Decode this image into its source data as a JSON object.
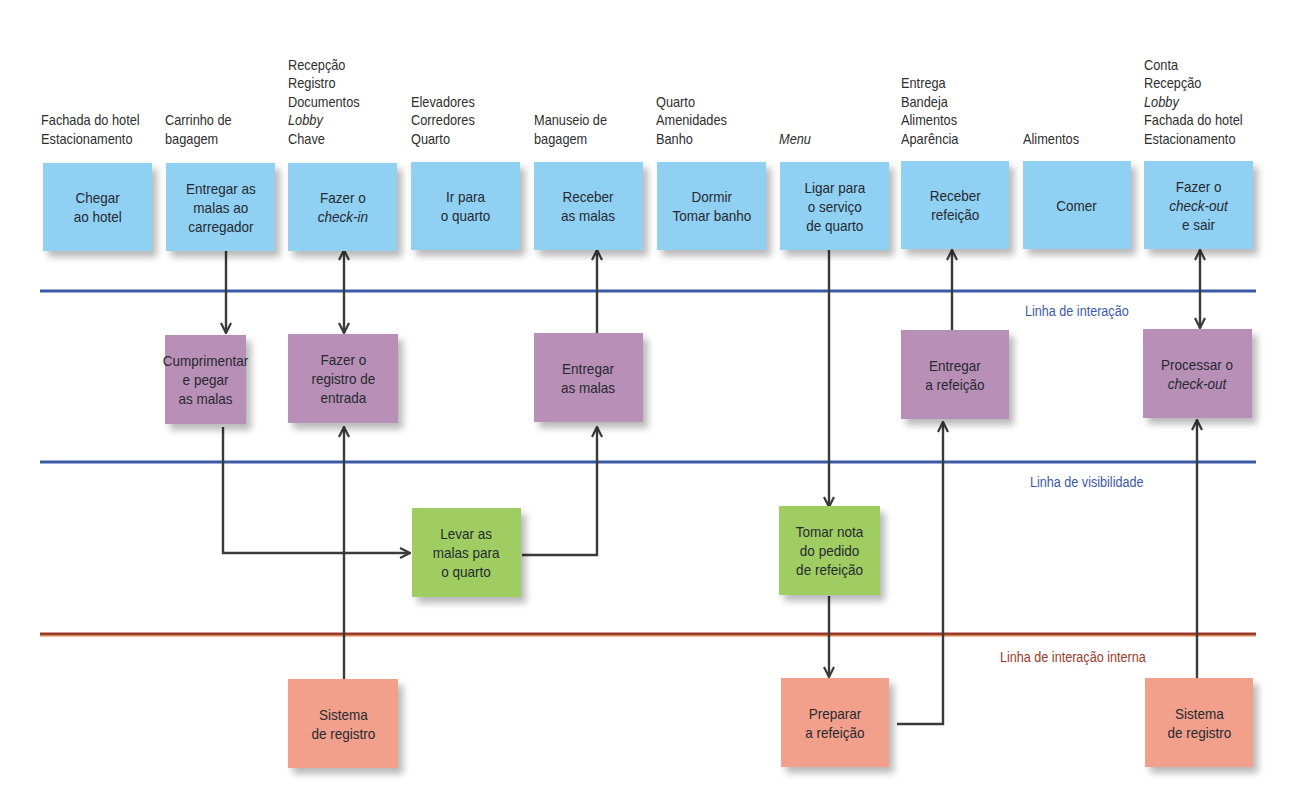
{
  "diagram": {
    "type": "service-blueprint",
    "colors": {
      "customer_actions": "#8fd0f3",
      "onstage_actions": "#b88fb6",
      "backstage_actions": "#9fcd62",
      "support_processes": "#f2a08b",
      "line_interaction": "#3b5aa6",
      "line_visibility": "#3b5aa6",
      "line_internal_interaction": "#9a3a2a",
      "arrow": "#3a3a3a"
    },
    "lines": {
      "interaction": "Linha de interação",
      "visibility": "Linha de visibilidade",
      "internal_interaction": "Linha de interação interna"
    },
    "physical_evidence": [
      {
        "lines": [
          {
            "t": "Fachada do hotel"
          },
          {
            "t": "Estacionamento"
          }
        ]
      },
      {
        "lines": [
          {
            "t": "Carrinho de"
          },
          {
            "t": "bagagem"
          }
        ]
      },
      {
        "lines": [
          {
            "t": "Recepção"
          },
          {
            "t": "Registro"
          },
          {
            "t": "Documentos"
          },
          {
            "t": "Lobby",
            "italic": true
          },
          {
            "t": "Chave"
          }
        ]
      },
      {
        "lines": [
          {
            "t": "Elevadores"
          },
          {
            "t": "Corredores"
          },
          {
            "t": "Quarto"
          }
        ]
      },
      {
        "lines": [
          {
            "t": "Manuseio de"
          },
          {
            "t": "bagagem"
          }
        ]
      },
      {
        "lines": [
          {
            "t": "Quarto"
          },
          {
            "t": "Amenidades"
          },
          {
            "t": "Banho"
          }
        ]
      },
      {
        "lines": [
          {
            "t": "Menu",
            "italic": true
          }
        ]
      },
      {
        "lines": [
          {
            "t": "Entrega"
          },
          {
            "t": "Bandeja"
          },
          {
            "t": "Alimentos"
          },
          {
            "t": "Aparência"
          }
        ]
      },
      {
        "lines": [
          {
            "t": "Alimentos"
          }
        ]
      },
      {
        "lines": [
          {
            "t": "Conta"
          },
          {
            "t": "Recepção"
          },
          {
            "t": "Lobby",
            "italic": true
          },
          {
            "t": "Fachada do hotel"
          },
          {
            "t": "Estacionamento"
          }
        ]
      }
    ],
    "customer_actions": [
      {
        "lines": [
          {
            "t": "Chegar"
          },
          {
            "t": "ao hotel"
          }
        ]
      },
      {
        "lines": [
          {
            "t": "Entregar as"
          },
          {
            "t": "malas ao"
          },
          {
            "t": "carregador"
          }
        ]
      },
      {
        "lines": [
          {
            "t": "Fazer o"
          },
          {
            "t": "check-in",
            "italic": true
          }
        ]
      },
      {
        "lines": [
          {
            "t": "Ir para"
          },
          {
            "t": "o quarto"
          }
        ]
      },
      {
        "lines": [
          {
            "t": "Receber"
          },
          {
            "t": "as malas"
          }
        ]
      },
      {
        "lines": [
          {
            "t": "Dormir"
          },
          {
            "t": "Tomar banho"
          }
        ]
      },
      {
        "lines": [
          {
            "t": "Ligar para"
          },
          {
            "t": "o serviço"
          },
          {
            "t": "de quarto"
          }
        ]
      },
      {
        "lines": [
          {
            "t": "Receber"
          },
          {
            "t": "refeição"
          }
        ]
      },
      {
        "lines": [
          {
            "t": "Comer"
          }
        ]
      },
      {
        "lines": [
          {
            "t": "Fazer o"
          },
          {
            "t": "check-out",
            "italic": true
          },
          {
            "t": "e sair"
          }
        ]
      }
    ],
    "onstage_actions": [
      {
        "lines": [
          {
            "t": "Cumprimentar"
          },
          {
            "t": "e pegar"
          },
          {
            "t": "as malas"
          }
        ]
      },
      {
        "lines": [
          {
            "t": "Fazer o"
          },
          {
            "t": "registro de"
          },
          {
            "t": "entrada"
          }
        ]
      },
      {
        "lines": [
          {
            "t": "Entregar"
          },
          {
            "t": "as malas"
          }
        ]
      },
      {
        "lines": [
          {
            "t": "Entregar"
          },
          {
            "t": "a refeição"
          }
        ]
      },
      {
        "lines": [
          {
            "t": "Processar o"
          },
          {
            "t": "check-out",
            "italic": true
          }
        ]
      }
    ],
    "backstage_actions": [
      {
        "lines": [
          {
            "t": "Levar as"
          },
          {
            "t": "malas para"
          },
          {
            "t": "o quarto"
          }
        ]
      },
      {
        "lines": [
          {
            "t": "Tomar nota"
          },
          {
            "t": "do pedido"
          },
          {
            "t": "de refeição"
          }
        ]
      }
    ],
    "support_processes": [
      {
        "lines": [
          {
            "t": "Sistema"
          },
          {
            "t": "de registro"
          }
        ]
      },
      {
        "lines": [
          {
            "t": "Preparar"
          },
          {
            "t": "a refeição"
          }
        ]
      },
      {
        "lines": [
          {
            "t": "Sistema"
          },
          {
            "t": "de registro"
          }
        ]
      }
    ]
  }
}
